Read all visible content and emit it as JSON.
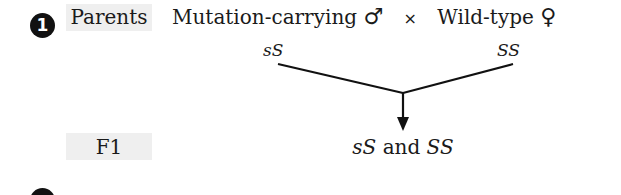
{
  "diagram": {
    "step_number": "1",
    "rows": [
      {
        "label": "Parents"
      },
      {
        "label": "F1"
      }
    ],
    "parents": {
      "male": {
        "description": "Mutation-carrying",
        "symbol": "♂",
        "genotype": "sS"
      },
      "cross_symbol": "×",
      "female": {
        "description": "Wild-type",
        "symbol": "♀",
        "genotype": "SS"
      }
    },
    "f1": {
      "genotype_a": "sS",
      "connector": " and ",
      "genotype_b": "SS"
    },
    "colors": {
      "label_background": "#efefef",
      "line": "#111111",
      "text": "#1a1a1a"
    }
  }
}
